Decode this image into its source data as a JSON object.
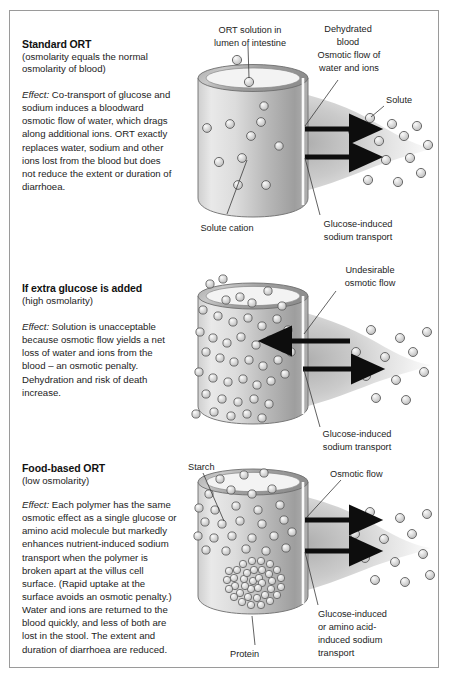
{
  "figure": {
    "type": "scientific-diagram",
    "border_color": "#9a9a9a",
    "background": "#ffffff"
  },
  "panels": [
    {
      "id": "standard-ort",
      "title": "Standard ORT",
      "subtitle": "(osmolarity equals the normal osmolarity of blood)",
      "effect_label": "Effect:",
      "effect_text": " Co-transport of glucose and sodium induces a bloodward osmotic flow of water, which drags along additional ions. ORT exactly replaces water, sodium and other ions lost from the blood but does not reduce the extent or duration of diarrhoea.",
      "labels": {
        "lumen": "ORT solution in\nlumen of intestine",
        "dehydrated_blood": "Dehydrated\nblood",
        "osmotic_flow": "Osmotic flow of\nwater and ions",
        "solute": "Solute",
        "solute_cation": "Solute cation",
        "sodium_transport": "Glucose-induced\nsodium transport"
      },
      "arrows": [
        {
          "name": "osmotic-flow-arrow-upper",
          "direction": "right"
        },
        {
          "name": "sodium-transport-arrow-lower",
          "direction": "right"
        }
      ],
      "particle_density": "sparse"
    },
    {
      "id": "extra-glucose",
      "title": "If extra glucose is added",
      "subtitle": "(high osmolarity)",
      "effect_label": "Effect:",
      "effect_text": " Solution is unacceptable because osmotic flow yields a net loss of water and ions from the blood – an osmotic penalty. Dehydration and risk of death increase.",
      "labels": {
        "undesirable_flow": "Undesirable\nosmotic flow",
        "sodium_transport": "Glucose-induced\nsodium transport"
      },
      "arrows": [
        {
          "name": "undesirable-osmotic-flow-arrow",
          "direction": "left"
        },
        {
          "name": "sodium-transport-arrow",
          "direction": "right"
        }
      ],
      "particle_density": "dense"
    },
    {
      "id": "food-based-ort",
      "title": "Food-based ORT",
      "subtitle": "(low osmolarity)",
      "effect_label": "Effect:",
      "effect_text": " Each polymer has the same osmotic effect as a single glucose or amino acid molecule but markedly enhances nutrient-induced sodium transport when the polymer is broken apart at the villus cell surface. (Rapid uptake at the surface avoids an osmotic penalty.) Water and ions are returned to the blood quickly, and less of both are lost in the stool. The extent and duration of diarrhoea are reduced.",
      "labels": {
        "starch": "Starch",
        "protein": "Protein",
        "osmotic_flow": "Osmotic flow",
        "sodium_transport": "Glucose-induced\nor amino acid-\ninduced sodium\ntransport"
      },
      "arrows": [
        {
          "name": "osmotic-flow-arrow-upper",
          "direction": "right"
        },
        {
          "name": "sodium-transport-arrow-lower",
          "direction": "right"
        }
      ],
      "particle_density": "polymer-chains"
    }
  ],
  "colors": {
    "cylinder_light": "#e6e6e6",
    "cylinder_mid": "#b4b4b4",
    "cylinder_dark": "#8f8f8f",
    "particle_fill": "#d0d0d0",
    "particle_stroke": "#5a5a5a",
    "arrow": "#0d0d0d",
    "leader_line": "#3a3a3a",
    "plume": "#c9c9c9",
    "text": "#1c1c1c"
  }
}
